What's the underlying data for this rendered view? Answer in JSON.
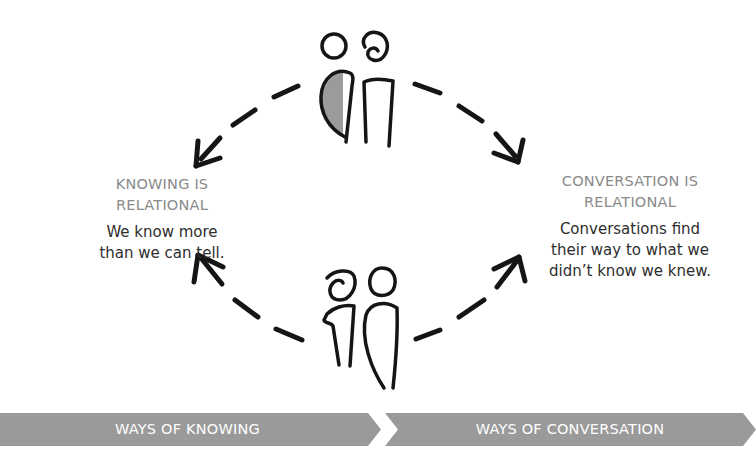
{
  "diagram": {
    "left": {
      "heading_line1": "KNOWING IS",
      "heading_line2": "RELATIONAL",
      "body_line1": "We know more",
      "body_line2": "than we can tell."
    },
    "right": {
      "heading_line1": "CONVERSATION IS",
      "heading_line2": "RELATIONAL",
      "body_line1": "Conversations find",
      "body_line2": "their way to what we",
      "body_line3": "didn’t know we knew."
    },
    "figures": {
      "top": "two-people-one-shaded-icon",
      "bottom": "two-people-outline-icon"
    },
    "arrows": [
      "dashed-arrow-top-left",
      "dashed-arrow-top-right",
      "dashed-arrow-bottom-left",
      "dashed-arrow-bottom-right"
    ]
  },
  "banner": {
    "left_label": "WAYS OF KNOWING",
    "right_label": "WAYS OF CONVERSATION",
    "color": "#9a9a9a"
  },
  "colors": {
    "heading": "#8a8a8a",
    "body": "#2e2e2e",
    "stroke": "#151515",
    "figure_fill": "#9b9b9b"
  }
}
